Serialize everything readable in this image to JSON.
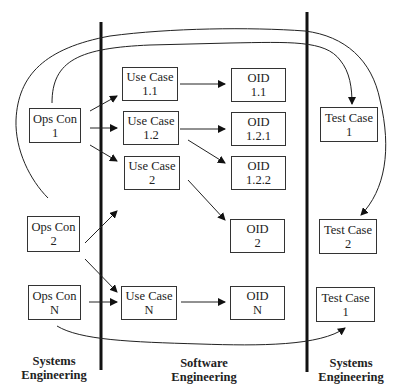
{
  "lanes": [
    {
      "id": "lane-systems-left",
      "line1": "Systems",
      "line2": "Engineering"
    },
    {
      "id": "lane-software",
      "line1": "Software",
      "line2": "Engineering"
    },
    {
      "id": "lane-systems-right",
      "line1": "Systems",
      "line2": "Engineering"
    }
  ],
  "nodes": {
    "ops_con_1": {
      "line1": "Ops Con",
      "line2": "1"
    },
    "ops_con_2": {
      "line1": "Ops Con",
      "line2": "2"
    },
    "ops_con_n": {
      "line1": "Ops Con",
      "line2": "N"
    },
    "use_case_1_1": {
      "line1": "Use Case",
      "line2": "1.1"
    },
    "use_case_1_2": {
      "line1": "Use Case",
      "line2": "1.2"
    },
    "use_case_2": {
      "line1": "Use Case",
      "line2": "2"
    },
    "use_case_n": {
      "line1": "Use Case",
      "line2": "N"
    },
    "oid_1_1": {
      "line1": "OID",
      "line2": "1.1"
    },
    "oid_1_2_1": {
      "line1": "OID",
      "line2": "1.2.1"
    },
    "oid_1_2_2": {
      "line1": "OID",
      "line2": "1.2.2"
    },
    "oid_2": {
      "line1": "OID",
      "line2": "2"
    },
    "oid_n": {
      "line1": "OID",
      "line2": "N"
    },
    "test_case_1_top": {
      "line1": "Test Case",
      "line2": "1"
    },
    "test_case_2": {
      "line1": "Test Case",
      "line2": "2"
    },
    "test_case_1_bottom": {
      "line1": "Test Case",
      "line2": "1"
    }
  },
  "edges": [
    [
      "ops_con_1",
      "use_case_1_1"
    ],
    [
      "ops_con_1",
      "use_case_1_2"
    ],
    [
      "ops_con_1",
      "use_case_2"
    ],
    [
      "ops_con_2",
      "use_case_2"
    ],
    [
      "ops_con_2",
      "use_case_n"
    ],
    [
      "ops_con_n",
      "use_case_n"
    ],
    [
      "use_case_1_1",
      "oid_1_1"
    ],
    [
      "use_case_1_2",
      "oid_1_2_1"
    ],
    [
      "use_case_1_2",
      "oid_1_2_2"
    ],
    [
      "use_case_2",
      "oid_2"
    ],
    [
      "use_case_n",
      "oid_n"
    ],
    [
      "ops_con_1",
      "test_case_1_top"
    ],
    [
      "ops_con_2",
      "test_case_2"
    ],
    [
      "ops_con_n",
      "test_case_1_bottom"
    ]
  ]
}
